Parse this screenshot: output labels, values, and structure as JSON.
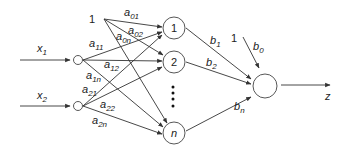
{
  "inputs": [
    {
      "id": "x1",
      "label": "x",
      "sub": "1"
    },
    {
      "id": "x2",
      "label": "x",
      "sub": "2"
    }
  ],
  "bias_input_label": "1",
  "hidden_nodes": [
    {
      "id": "h1",
      "label": "1"
    },
    {
      "id": "h2",
      "label": "2"
    },
    {
      "id": "hn",
      "label": "n"
    }
  ],
  "ellipsis": "⋮",
  "input_weights": [
    {
      "label": "a",
      "sub": "01"
    },
    {
      "label": "a",
      "sub": "02"
    },
    {
      "label": "a",
      "sub": "0n"
    },
    {
      "label": "a",
      "sub": "11"
    },
    {
      "label": "a",
      "sub": "12"
    },
    {
      "label": "a",
      "sub": "1n"
    },
    {
      "label": "a",
      "sub": "21"
    },
    {
      "label": "a",
      "sub": "22"
    },
    {
      "label": "a",
      "sub": "2n"
    }
  ],
  "output_bias_label": "1",
  "output_weights": [
    {
      "label": "b",
      "sub": "0"
    },
    {
      "label": "b",
      "sub": "1"
    },
    {
      "label": "b",
      "sub": "2"
    },
    {
      "label": "b",
      "sub": "n"
    }
  ],
  "output": {
    "label": "z"
  },
  "colors": {
    "stroke": "#333333",
    "background": "#ffffff"
  }
}
